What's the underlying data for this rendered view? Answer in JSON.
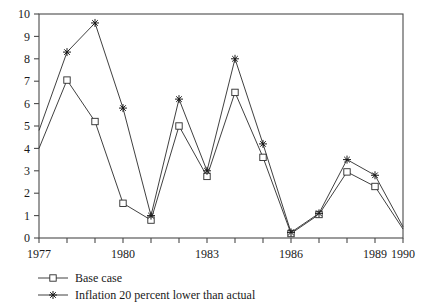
{
  "chart_data": {
    "type": "line",
    "title": "",
    "subtitle": "",
    "xlabel": "",
    "ylabel": "",
    "x": [
      1977,
      1978,
      1979,
      1980,
      1981,
      1982,
      1983,
      1984,
      1985,
      1986,
      1987,
      1988,
      1989,
      1990
    ],
    "xlim": [
      1977,
      1990
    ],
    "ylim": [
      0,
      10
    ],
    "yticks": [
      0,
      1,
      2,
      3,
      4,
      5,
      6,
      7,
      8,
      9,
      10
    ],
    "ytick_labels": [
      "0",
      "1",
      "2",
      "3",
      "4",
      "5",
      "6",
      "7",
      "8",
      "9",
      "10"
    ],
    "xticks": [
      1977,
      1978,
      1979,
      1980,
      1981,
      1982,
      1983,
      1984,
      1985,
      1986,
      1987,
      1988,
      1989,
      1990
    ],
    "xtick_labels_shown": [
      "1977",
      "1980",
      "1983",
      "1986",
      "1989",
      "1990"
    ],
    "xtick_labeled_values": [
      1977,
      1980,
      1983,
      1986,
      1989,
      1990
    ],
    "grid": false,
    "legend_position": "below-left",
    "series": [
      {
        "name": "Base case",
        "marker": "square",
        "values": [
          4.0,
          7.05,
          5.2,
          1.55,
          0.8,
          5.0,
          2.75,
          6.5,
          3.6,
          0.2,
          1.05,
          2.95,
          2.3,
          0.4
        ]
      },
      {
        "name": "Inflation 20 percent lower than actual",
        "marker": "plus",
        "values": [
          4.8,
          8.3,
          9.6,
          5.8,
          1.0,
          6.2,
          3.0,
          8.0,
          4.2,
          0.25,
          1.1,
          3.5,
          2.8,
          0.5
        ]
      }
    ]
  },
  "legend": {
    "items": [
      {
        "label": "Base case",
        "marker": "square"
      },
      {
        "label": "Inflation 20 percent lower than actual",
        "marker": "plus"
      }
    ]
  }
}
